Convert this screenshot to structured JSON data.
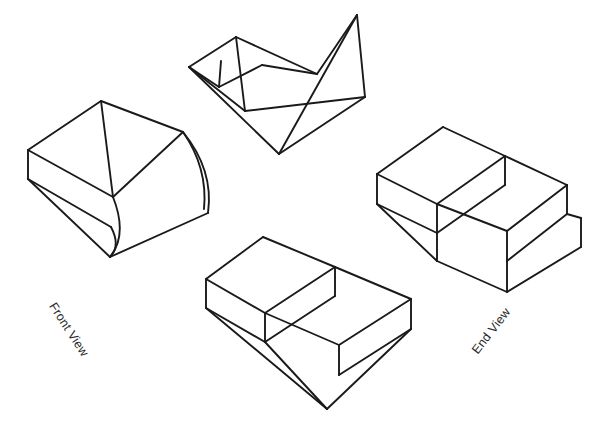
{
  "page": {
    "title": "Isometric Solids Drawing",
    "background_color": "#ffffff",
    "line_color": "#1a1a1a",
    "width": 594,
    "height": 434
  },
  "labels": {
    "front_view": "Front View",
    "end_view": "End View"
  },
  "figures": [
    {
      "id": "curved-block",
      "name": "Curved Top Block",
      "position": "left-middle",
      "description": "Isometric wireframe block with a concave curved surface sweeping from the top face down the front"
    },
    {
      "id": "vee-wedge",
      "name": "V Groove Wedge",
      "position": "top-center",
      "description": "Isometric wireframe wedge with a V shaped groove cut across its sloping top face"
    },
    {
      "id": "notched-block",
      "name": "Notched Rectangular Block",
      "position": "right-middle",
      "description": "Isometric wireframe rectangular block with a rectangular notch cut into its top face"
    },
    {
      "id": "plain-box",
      "name": "Rectangular Prism",
      "position": "bottom-center",
      "description": "Isometric wireframe rectangular prism with an open top showing inner walls"
    }
  ],
  "figure_geometry": {
    "curved_block": {
      "outline": "M 30,150 L 102,102 L 184,133 L 160,213 L 112,260 L 30,179 Z",
      "segments": [
        "M 30,150 L 102,102",
        "M 102,102 L 184,133",
        "M 30,150 L 30,179",
        "M 30,179 L 112,260",
        "M 112,260 L 209,215",
        "M 184,133 L 209,215",
        "M 30,150 L 114,198",
        "M 114,198 L 184,133",
        "M 102,102 L 114,198",
        "M 30,179 L 110,131",
        "M 110,131 L 114,198"
      ],
      "curves": [
        "M 184,133 Q 214,168 209,215",
        "M 114,198 Q 120,234 112,260",
        "M 30,179 Q 62,176 76,199"
      ]
    },
    "vee_wedge": {
      "segments": [
        "M 190,68 L 236,38",
        "M 236,38 L 318,75",
        "M 318,75 L 358,16",
        "M 358,16 L 366,98",
        "M 190,68 L 220,88",
        "M 220,88 L 262,66",
        "M 262,66 L 318,75",
        "M 220,88 L 222,62",
        "M 190,68 L 280,155",
        "M 280,155 L 366,98",
        "M 358,16 L 280,155",
        "M 190,68 L 246,112",
        "M 246,112 L 366,98",
        "M 236,38 L 246,112"
      ]
    },
    "notched_block": {
      "segments": [
        "M 378,175 L 444,128",
        "M 444,128 L 506,157",
        "M 506,157 L 438,205",
        "M 438,205 L 378,175",
        "M 378,175 L 378,205",
        "M 378,205 L 438,234",
        "M 438,234 L 438,205",
        "M 506,157 L 506,185",
        "M 438,234 L 506,185",
        "M 506,157 L 568,186",
        "M 568,186 L 508,232",
        "M 508,232 L 438,205",
        "M 568,186 L 568,215",
        "M 568,215 L 508,262",
        "M 508,262 L 508,232",
        "M 438,234 L 438,262",
        "M 438,262 L 508,293",
        "M 508,293 L 508,262",
        "M 378,205 L 438,262",
        "M 508,293 L 582,248"
      ]
    },
    "plain_box": {
      "segments": [
        "M 207,280 L 264,238",
        "M 264,238 L 336,268",
        "M 336,268 L 266,314",
        "M 266,314 L 207,280",
        "M 207,280 L 207,309",
        "M 207,309 L 266,343",
        "M 266,343 L 266,314",
        "M 336,268 L 336,297",
        "M 266,343 L 336,297",
        "M 336,268 L 412,300",
        "M 412,300 L 340,346",
        "M 340,346 L 266,314",
        "M 412,300 L 412,330",
        "M 412,330 L 340,376",
        "M 340,376 L 340,346",
        "M 207,309 L 328,410",
        "M 328,410 L 412,330",
        "M 266,343 L 328,410"
      ]
    }
  }
}
